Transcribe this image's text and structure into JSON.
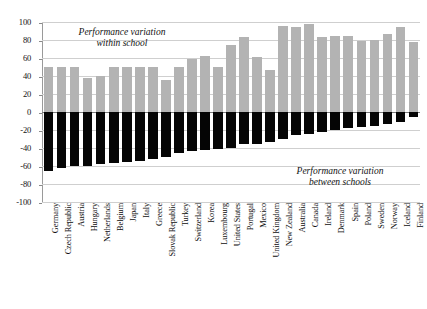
{
  "chart_data": {
    "type": "bar",
    "title": "",
    "subtitle": "",
    "xlabel": "",
    "ylabel": "",
    "ylim": [
      -100,
      100
    ],
    "ytick_labels": [
      "100",
      "80",
      "60",
      "40",
      "20",
      "0",
      "-20",
      "-40",
      "-60",
      "-80",
      "-100"
    ],
    "ytick_values": [
      100,
      80,
      60,
      40,
      20,
      0,
      -20,
      -40,
      -60,
      -80,
      -100
    ],
    "grid": true,
    "legend": "none",
    "stacked": false,
    "orientation": "vertical",
    "annotations": [
      {
        "id": "within",
        "text": "Performance variation\nwithin school"
      },
      {
        "id": "between",
        "text": "Performance variation\nbetween schools"
      }
    ],
    "categories": [
      "Germany",
      "Czech Republic",
      "Austria",
      "Hungary",
      "Netherlands",
      "Belgium",
      "Japan",
      "Italy",
      "Greece",
      "Slovak Republic",
      "Turkey",
      "Switzerland",
      "Korea",
      "Luxembourg",
      "United States",
      "Portugal",
      "Mexico",
      "United Kingdom",
      "New Zealand",
      "Australia",
      "Canada",
      "Ireland",
      "Denmark",
      "Spain",
      "Poland",
      "Sweden",
      "Norway",
      "Iceland",
      "Finland"
    ],
    "series": [
      {
        "name": "Performance variation within school",
        "color": "#b3b3b3",
        "values": [
          50,
          50,
          50,
          38,
          40,
          50,
          50,
          50,
          50,
          36,
          50,
          59,
          62,
          50,
          74,
          83,
          61,
          47,
          96,
          94,
          98,
          83,
          85,
          84,
          79,
          80,
          87,
          94,
          78
        ]
      },
      {
        "name": "Performance variation between schools",
        "color": "#050505",
        "values": [
          -66,
          -62,
          -60,
          -60,
          -58,
          -57,
          -56,
          -54,
          -52,
          -50,
          -46,
          -43,
          -42,
          -41,
          -40,
          -36,
          -35,
          -33,
          -30,
          -26,
          -24,
          -22,
          -20,
          -18,
          -17,
          -15,
          -13,
          -11,
          -5
        ]
      }
    ]
  }
}
